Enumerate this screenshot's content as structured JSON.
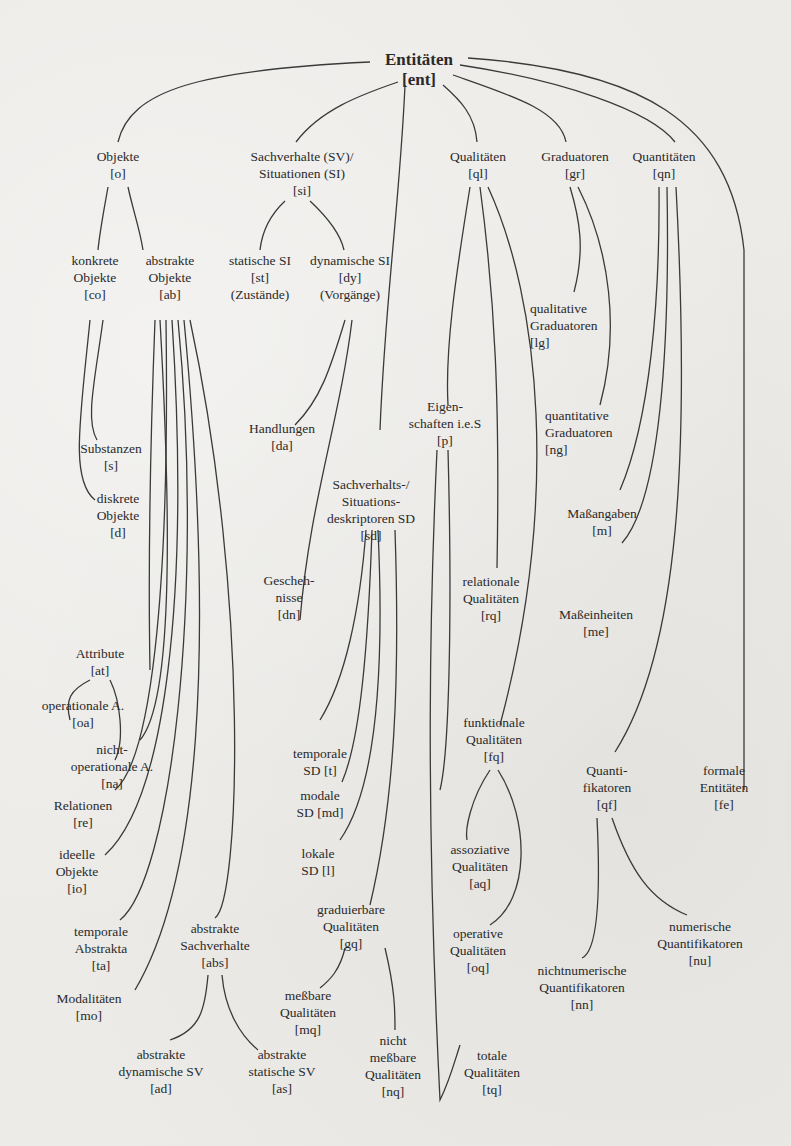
{
  "diagram": {
    "title": "Entitäten [ent]",
    "nodes": {
      "ent": {
        "lines": [
          "Entitäten",
          "[ent]"
        ]
      },
      "o": {
        "lines": [
          "Objekte",
          "[o]"
        ]
      },
      "si": {
        "lines": [
          "Sachverhalte (SV)/",
          "Situationen (SI)",
          "[si]"
        ]
      },
      "ql": {
        "lines": [
          "Qualitäten",
          "[ql]"
        ]
      },
      "gr": {
        "lines": [
          "Graduatoren",
          "[gr]"
        ]
      },
      "qn": {
        "lines": [
          "Quantitäten",
          "[qn]"
        ]
      },
      "co": {
        "lines": [
          "konkrete",
          "Objekte",
          "[co]"
        ]
      },
      "ab": {
        "lines": [
          "abstrakte",
          "Objekte",
          "[ab]"
        ]
      },
      "st": {
        "lines": [
          "statische SI",
          "[st]",
          "(Zustände)"
        ]
      },
      "dy": {
        "lines": [
          "dynamische SI",
          "[dy]",
          "(Vorgänge)"
        ]
      },
      "lg": {
        "lines": [
          "qualitative",
          "Graduatoren",
          "[lg]"
        ]
      },
      "ng": {
        "lines": [
          "quantitative",
          "Graduatoren",
          "[ng]"
        ]
      },
      "p": {
        "lines": [
          "Eigen-",
          "schaften i.e.S",
          "[p]"
        ]
      },
      "da": {
        "lines": [
          "Handlungen",
          "[da]"
        ]
      },
      "s": {
        "lines": [
          "Substanzen",
          "[s]"
        ]
      },
      "d": {
        "lines": [
          "diskrete",
          "Objekte",
          "[d]"
        ]
      },
      "sd": {
        "lines": [
          "Sachverhalts-/",
          "Situations-",
          "deskriptoren SD",
          "[sd]"
        ]
      },
      "m": {
        "lines": [
          "Maßangaben",
          "[m]"
        ]
      },
      "dn": {
        "lines": [
          "Gescheh-",
          "nisse",
          "[dn]"
        ]
      },
      "rq": {
        "lines": [
          "relationale",
          "Qualitäten",
          "[rq]"
        ]
      },
      "me": {
        "lines": [
          "Maßeinheiten",
          "[me]"
        ]
      },
      "at": {
        "lines": [
          "Attribute",
          "[at]"
        ]
      },
      "oa": {
        "lines": [
          "operationale A.",
          "[oa]"
        ]
      },
      "na": {
        "lines": [
          "nicht-",
          "operationale A.",
          "[na]"
        ]
      },
      "fq": {
        "lines": [
          "funktionale",
          "Qualitäten",
          "[fq]"
        ]
      },
      "qf": {
        "lines": [
          "Quanti-",
          "fikatoren",
          "[qf]"
        ]
      },
      "fe": {
        "lines": [
          "formale",
          "Entitäten",
          "[fe]"
        ]
      },
      "t": {
        "lines": [
          "temporale",
          "SD  [t]"
        ]
      },
      "re": {
        "lines": [
          "Relationen",
          "[re]"
        ]
      },
      "md": {
        "lines": [
          "modale",
          "SD  [md]"
        ]
      },
      "io": {
        "lines": [
          "ideelle",
          "Objekte",
          "[io]"
        ]
      },
      "aq": {
        "lines": [
          "assoziative",
          "Qualitäten",
          "[aq]"
        ]
      },
      "l": {
        "lines": [
          "lokale",
          "SD  [l]"
        ]
      },
      "gq": {
        "lines": [
          "graduierbare",
          "Qualitäten",
          "[gq]"
        ]
      },
      "abs": {
        "lines": [
          "abstrakte",
          "Sachverhalte",
          "[abs]"
        ]
      },
      "ta": {
        "lines": [
          "temporale",
          "Abstrakta",
          "[ta]"
        ]
      },
      "oq": {
        "lines": [
          "operative",
          "Qualitäten",
          "[oq]"
        ]
      },
      "nu": {
        "lines": [
          "numerische",
          "Quantifikatoren",
          "[nu]"
        ]
      },
      "mo": {
        "lines": [
          "Modalitäten",
          "[mo]"
        ]
      },
      "mq": {
        "lines": [
          "meßbare",
          "Qualitäten",
          "[mq]"
        ]
      },
      "nn": {
        "lines": [
          "nichtnumerische",
          "Quantifikatoren",
          "[nn]"
        ]
      },
      "ad": {
        "lines": [
          "abstrakte",
          "dynamische SV",
          "[ad]"
        ]
      },
      "as": {
        "lines": [
          "abstrakte",
          "statische SV",
          "[as]"
        ]
      },
      "nq": {
        "lines": [
          "nicht",
          "meßbare",
          "Qualitäten",
          "[nq]"
        ]
      },
      "tq": {
        "lines": [
          "totale",
          "Qualitäten",
          "[tq]"
        ]
      }
    }
  }
}
